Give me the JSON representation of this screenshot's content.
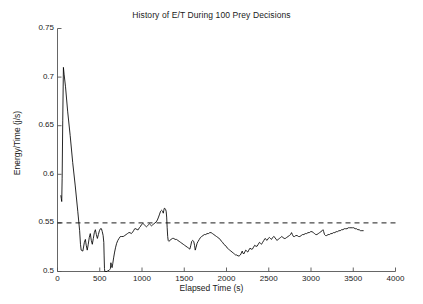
{
  "chart_data": {
    "type": "line",
    "title": "History of E/T During 100 Prey Decisions",
    "xlabel": "Elapsed Time (s)",
    "ylabel": "Energy/Time (j/s)",
    "xlim": [
      0,
      4000
    ],
    "ylim": [
      0.5,
      0.75
    ],
    "xticks": [
      0,
      500,
      1000,
      1500,
      2000,
      2500,
      3000,
      3500,
      4000
    ],
    "xtick_labels": [
      "0",
      "500",
      "1000",
      "1500",
      "2000",
      "2500",
      "3000",
      "3500",
      "4000"
    ],
    "yticks": [
      0.5,
      0.55,
      0.6,
      0.65,
      0.7,
      0.75
    ],
    "ytick_labels": [
      "0.5",
      "0.55",
      "0.6",
      "0.65",
      "0.7",
      "0.75"
    ],
    "grid": false,
    "legend": null,
    "line_color": "#000000",
    "reference_line": {
      "name": "threshold",
      "orientation": "horizontal",
      "y": 0.55,
      "style": "dashed",
      "color": "#000000"
    },
    "series": [
      {
        "name": "E/T history",
        "style": "solid",
        "points": [
          [
            40,
            0.578
          ],
          [
            45,
            0.575
          ],
          [
            50,
            0.572
          ],
          [
            55,
            0.596
          ],
          [
            62,
            0.655
          ],
          [
            70,
            0.71
          ],
          [
            78,
            0.703
          ],
          [
            95,
            0.69
          ],
          [
            120,
            0.665
          ],
          [
            150,
            0.64
          ],
          [
            180,
            0.612
          ],
          [
            210,
            0.588
          ],
          [
            240,
            0.562
          ],
          [
            262,
            0.542
          ],
          [
            272,
            0.528
          ],
          [
            280,
            0.522
          ],
          [
            300,
            0.521
          ],
          [
            318,
            0.53
          ],
          [
            330,
            0.533
          ],
          [
            340,
            0.527
          ],
          [
            352,
            0.522
          ],
          [
            364,
            0.528
          ],
          [
            376,
            0.535
          ],
          [
            388,
            0.539
          ],
          [
            400,
            0.532
          ],
          [
            412,
            0.528
          ],
          [
            424,
            0.534
          ],
          [
            436,
            0.54
          ],
          [
            448,
            0.543
          ],
          [
            460,
            0.538
          ],
          [
            472,
            0.534
          ],
          [
            484,
            0.538
          ],
          [
            496,
            0.542
          ],
          [
            508,
            0.544
          ],
          [
            520,
            0.544
          ],
          [
            530,
            0.541
          ],
          [
            540,
            0.537
          ],
          [
            548,
            0.53
          ],
          [
            552,
            0.516
          ],
          [
            556,
            0.503
          ],
          [
            560,
            0.5
          ],
          [
            566,
            0.5
          ],
          [
            575,
            0.5
          ],
          [
            585,
            0.5
          ],
          [
            596,
            0.501
          ],
          [
            608,
            0.501
          ],
          [
            618,
            0.502
          ],
          [
            626,
            0.503
          ],
          [
            632,
            0.509
          ],
          [
            638,
            0.506
          ],
          [
            646,
            0.504
          ],
          [
            654,
            0.508
          ],
          [
            664,
            0.514
          ],
          [
            676,
            0.52
          ],
          [
            688,
            0.525
          ],
          [
            700,
            0.529
          ],
          [
            714,
            0.532
          ],
          [
            728,
            0.534
          ],
          [
            744,
            0.536
          ],
          [
            760,
            0.536
          ],
          [
            778,
            0.536
          ],
          [
            796,
            0.537
          ],
          [
            812,
            0.538
          ],
          [
            828,
            0.539
          ],
          [
            844,
            0.54
          ],
          [
            858,
            0.54
          ],
          [
            872,
            0.539
          ],
          [
            886,
            0.54
          ],
          [
            900,
            0.542
          ],
          [
            914,
            0.544
          ],
          [
            928,
            0.544
          ],
          [
            942,
            0.543
          ],
          [
            956,
            0.543
          ],
          [
            968,
            0.545
          ],
          [
            980,
            0.546
          ],
          [
            992,
            0.548
          ],
          [
            1004,
            0.549
          ],
          [
            1016,
            0.549
          ],
          [
            1028,
            0.548
          ],
          [
            1040,
            0.547
          ],
          [
            1052,
            0.546
          ],
          [
            1064,
            0.547
          ],
          [
            1076,
            0.548
          ],
          [
            1088,
            0.549
          ],
          [
            1100,
            0.548
          ],
          [
            1112,
            0.547
          ],
          [
            1126,
            0.548
          ],
          [
            1140,
            0.549
          ],
          [
            1154,
            0.55
          ],
          [
            1168,
            0.551
          ],
          [
            1182,
            0.553
          ],
          [
            1196,
            0.556
          ],
          [
            1208,
            0.559
          ],
          [
            1220,
            0.562
          ],
          [
            1232,
            0.563
          ],
          [
            1244,
            0.562
          ],
          [
            1252,
            0.56
          ],
          [
            1258,
            0.563
          ],
          [
            1264,
            0.565
          ],
          [
            1270,
            0.565
          ],
          [
            1278,
            0.564
          ],
          [
            1286,
            0.562
          ],
          [
            1292,
            0.556
          ],
          [
            1298,
            0.545
          ],
          [
            1304,
            0.536
          ],
          [
            1310,
            0.532
          ],
          [
            1318,
            0.531
          ],
          [
            1330,
            0.532
          ],
          [
            1344,
            0.533
          ],
          [
            1360,
            0.534
          ],
          [
            1376,
            0.534
          ],
          [
            1392,
            0.533
          ],
          [
            1408,
            0.533
          ],
          [
            1424,
            0.532
          ],
          [
            1440,
            0.531
          ],
          [
            1456,
            0.53
          ],
          [
            1472,
            0.529
          ],
          [
            1488,
            0.528
          ],
          [
            1504,
            0.527
          ],
          [
            1520,
            0.526
          ],
          [
            1536,
            0.525
          ],
          [
            1552,
            0.524
          ],
          [
            1566,
            0.523
          ],
          [
            1578,
            0.527
          ],
          [
            1588,
            0.531
          ],
          [
            1600,
            0.532
          ],
          [
            1612,
            0.531
          ],
          [
            1622,
            0.527
          ],
          [
            1630,
            0.522
          ],
          [
            1640,
            0.525
          ],
          [
            1652,
            0.529
          ],
          [
            1664,
            0.531
          ],
          [
            1678,
            0.533
          ],
          [
            1692,
            0.535
          ],
          [
            1706,
            0.536
          ],
          [
            1722,
            0.537
          ],
          [
            1738,
            0.538
          ],
          [
            1754,
            0.538
          ],
          [
            1770,
            0.539
          ],
          [
            1786,
            0.539
          ],
          [
            1802,
            0.54
          ],
          [
            1818,
            0.54
          ],
          [
            1834,
            0.539
          ],
          [
            1850,
            0.538
          ],
          [
            1866,
            0.537
          ],
          [
            1882,
            0.536
          ],
          [
            1898,
            0.535
          ],
          [
            1912,
            0.534
          ],
          [
            1926,
            0.533
          ],
          [
            1940,
            0.531
          ],
          [
            1954,
            0.53
          ],
          [
            1968,
            0.528
          ],
          [
            1982,
            0.527
          ],
          [
            1996,
            0.526
          ],
          [
            2010,
            0.524
          ],
          [
            2024,
            0.523
          ],
          [
            2038,
            0.522
          ],
          [
            2052,
            0.521
          ],
          [
            2066,
            0.52
          ],
          [
            2080,
            0.519
          ],
          [
            2094,
            0.518
          ],
          [
            2108,
            0.517
          ],
          [
            2122,
            0.517
          ],
          [
            2136,
            0.516
          ],
          [
            2150,
            0.516
          ],
          [
            2164,
            0.517
          ],
          [
            2176,
            0.519
          ],
          [
            2186,
            0.521
          ],
          [
            2194,
            0.519
          ],
          [
            2204,
            0.518
          ],
          [
            2216,
            0.52
          ],
          [
            2228,
            0.522
          ],
          [
            2240,
            0.521
          ],
          [
            2252,
            0.52
          ],
          [
            2264,
            0.522
          ],
          [
            2278,
            0.524
          ],
          [
            2292,
            0.523
          ],
          [
            2306,
            0.523
          ],
          [
            2320,
            0.525
          ],
          [
            2334,
            0.527
          ],
          [
            2348,
            0.526
          ],
          [
            2362,
            0.526
          ],
          [
            2376,
            0.528
          ],
          [
            2390,
            0.53
          ],
          [
            2402,
            0.529
          ],
          [
            2414,
            0.528
          ],
          [
            2428,
            0.53
          ],
          [
            2442,
            0.532
          ],
          [
            2456,
            0.534
          ],
          [
            2468,
            0.533
          ],
          [
            2480,
            0.532
          ],
          [
            2494,
            0.534
          ],
          [
            2508,
            0.535
          ],
          [
            2520,
            0.534
          ],
          [
            2532,
            0.533
          ],
          [
            2546,
            0.535
          ],
          [
            2560,
            0.536
          ],
          [
            2574,
            0.535
          ],
          [
            2586,
            0.533
          ],
          [
            2598,
            0.532
          ],
          [
            2612,
            0.533
          ],
          [
            2626,
            0.534
          ],
          [
            2640,
            0.535
          ],
          [
            2654,
            0.536
          ],
          [
            2668,
            0.535
          ],
          [
            2682,
            0.534
          ],
          [
            2696,
            0.534
          ],
          [
            2712,
            0.535
          ],
          [
            2728,
            0.536
          ],
          [
            2744,
            0.537
          ],
          [
            2758,
            0.538
          ],
          [
            2770,
            0.54
          ],
          [
            2780,
            0.538
          ],
          [
            2792,
            0.536
          ],
          [
            2806,
            0.536
          ],
          [
            2820,
            0.537
          ],
          [
            2836,
            0.537
          ],
          [
            2852,
            0.536
          ],
          [
            2868,
            0.536
          ],
          [
            2884,
            0.537
          ],
          [
            2900,
            0.538
          ],
          [
            2916,
            0.538
          ],
          [
            2932,
            0.539
          ],
          [
            2948,
            0.539
          ],
          [
            2964,
            0.54
          ],
          [
            2980,
            0.54
          ],
          [
            2996,
            0.541
          ],
          [
            3012,
            0.541
          ],
          [
            3028,
            0.54
          ],
          [
            3042,
            0.539
          ],
          [
            3056,
            0.538
          ],
          [
            3070,
            0.538
          ],
          [
            3086,
            0.539
          ],
          [
            3102,
            0.54
          ],
          [
            3118,
            0.541
          ],
          [
            3132,
            0.542
          ],
          [
            3142,
            0.543
          ],
          [
            3150,
            0.541
          ],
          [
            3160,
            0.538
          ],
          [
            3172,
            0.537
          ],
          [
            3186,
            0.537
          ],
          [
            3202,
            0.538
          ],
          [
            3218,
            0.538
          ],
          [
            3234,
            0.539
          ],
          [
            3250,
            0.539
          ],
          [
            3266,
            0.54
          ],
          [
            3282,
            0.54
          ],
          [
            3298,
            0.541
          ],
          [
            3314,
            0.541
          ],
          [
            3330,
            0.542
          ],
          [
            3346,
            0.542
          ],
          [
            3362,
            0.543
          ],
          [
            3378,
            0.543
          ],
          [
            3394,
            0.544
          ],
          [
            3410,
            0.544
          ],
          [
            3426,
            0.544
          ],
          [
            3442,
            0.545
          ],
          [
            3458,
            0.545
          ],
          [
            3474,
            0.545
          ],
          [
            3490,
            0.545
          ],
          [
            3506,
            0.545
          ],
          [
            3522,
            0.544
          ],
          [
            3538,
            0.544
          ],
          [
            3554,
            0.543
          ],
          [
            3570,
            0.543
          ],
          [
            3586,
            0.542
          ],
          [
            3602,
            0.542
          ],
          [
            3618,
            0.542
          ]
        ]
      }
    ]
  }
}
